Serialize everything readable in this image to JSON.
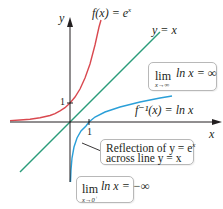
{
  "diagram": {
    "title": "",
    "axes": {
      "x_label": "x",
      "y_label": "y",
      "x_tick_label": "1",
      "y_tick_label": "1"
    },
    "curves": [
      {
        "name": "exponential",
        "label_prefix": "f(x) = e",
        "label_exp": "x",
        "color": "#d9484f"
      },
      {
        "name": "identity",
        "label": "y = x",
        "color": "#2a9c7a"
      },
      {
        "name": "natural-log",
        "label": "f⁻¹(x) = ln x",
        "color": "#2a9fd8"
      }
    ],
    "annotations": {
      "limit_infinity": {
        "lim": "lim",
        "sub": "x→∞",
        "expr": "ln x = ∞"
      },
      "limit_zero": {
        "lim": "lim",
        "sub": "x→0",
        "sub_sup": "+",
        "expr": "ln x = −∞"
      },
      "reflection": {
        "line1_prefix": "Reflection of y = e",
        "line1_exp": "x",
        "line2": "across line y = x"
      }
    },
    "colors": {
      "axis": "#231f20",
      "exp_curve": "#d9484f",
      "identity_line": "#2a9c7a",
      "log_curve": "#2a9fd8",
      "box_border": "#b8b8b8"
    }
  }
}
